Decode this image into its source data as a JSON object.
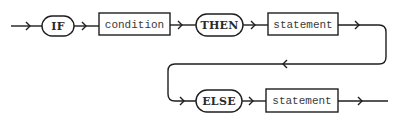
{
  "diagram": {
    "type": "syntax-railroad",
    "colors": {
      "stroke": "#1e1e1e",
      "text": "#2a2a2a",
      "background": "#ffffff"
    },
    "row1": {
      "nodes": [
        {
          "id": "if",
          "kind": "terminal",
          "label": "IF"
        },
        {
          "id": "condition",
          "kind": "nonterminal",
          "label": "condition"
        },
        {
          "id": "then",
          "kind": "terminal",
          "label": "THEN"
        },
        {
          "id": "statement1",
          "kind": "nonterminal",
          "label": "statement"
        }
      ]
    },
    "row2": {
      "nodes": [
        {
          "id": "else",
          "kind": "terminal",
          "label": "ELSE"
        },
        {
          "id": "statement2",
          "kind": "nonterminal",
          "label": "statement"
        }
      ]
    },
    "flow": [
      "IF",
      "condition",
      "THEN",
      "statement",
      "ELSE",
      "statement"
    ]
  }
}
